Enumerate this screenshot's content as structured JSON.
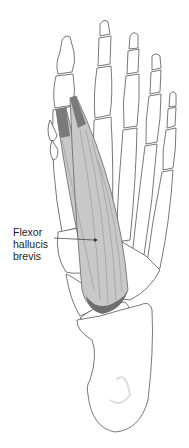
{
  "figure": {
    "label": {
      "lines": [
        "Flexor",
        "hallucis",
        "brevis"
      ]
    },
    "colors": {
      "background": "#ffffff",
      "bone_outline": "#555555",
      "bone_fill": "#ffffff",
      "muscle_fill": "#c8c8c8",
      "muscle_dark": "#6e6e6e",
      "muscle_fibers": "#8a8a8a",
      "label_text": "#222222"
    }
  }
}
